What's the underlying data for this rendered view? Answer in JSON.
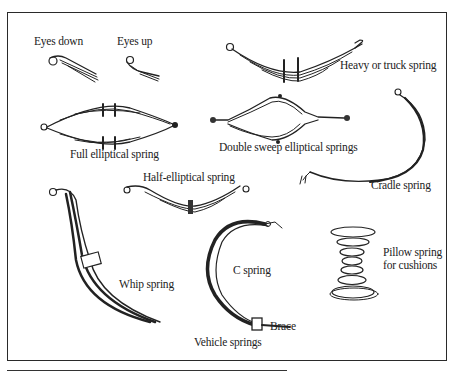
{
  "figure": {
    "caption": "Vehicle springs",
    "labels": {
      "eyes_down": "Eyes down",
      "eyes_up": "Eyes up",
      "heavy_truck": "Heavy or truck spring",
      "full_elliptical": "Full elliptical spring",
      "double_sweep": "Double sweep elliptical springs",
      "cradle": "Cradle spring",
      "half_elliptical": "Half-elliptical spring",
      "whip": "Whip spring",
      "c_spring": "C spring",
      "brace": "Brace",
      "pillow_line1": "Pillow spring",
      "pillow_line2": "for cushions"
    },
    "colors": {
      "ink": "#222222",
      "background": "#ffffff"
    }
  }
}
